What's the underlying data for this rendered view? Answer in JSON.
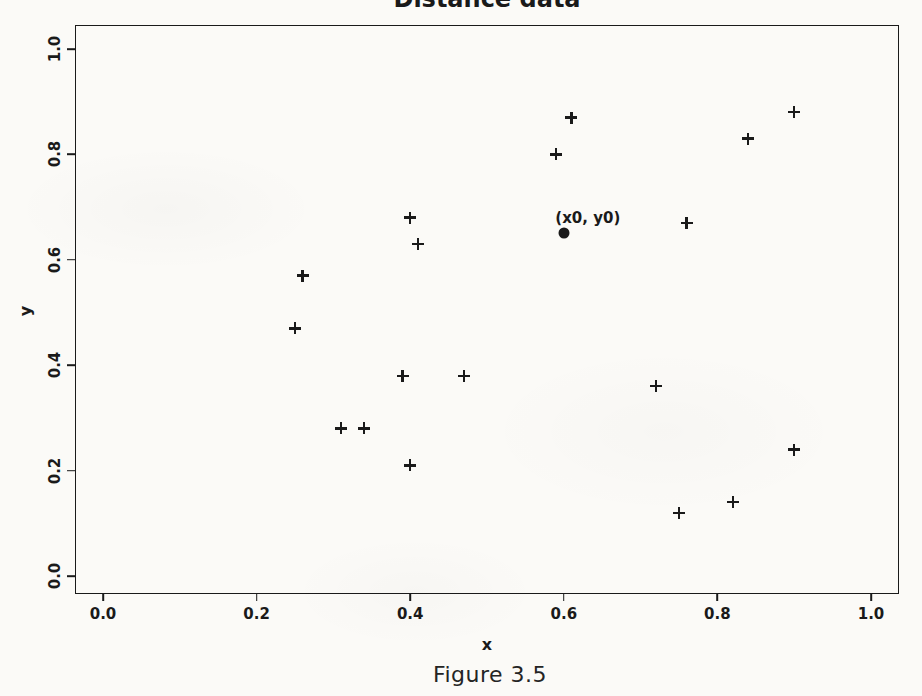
{
  "figure": {
    "caption": "Figure 3.5"
  },
  "colors": {
    "ink": "#1a1a1a",
    "paper": "#fbfaf7"
  },
  "chart_data": {
    "type": "scatter",
    "title": "Distance data",
    "xlabel": "x",
    "ylabel": "y",
    "xlim": [
      0,
      1.05
    ],
    "ylim": [
      0,
      1.02
    ],
    "grid": false,
    "legend": false,
    "marker": "+",
    "xticks": [
      "0.0",
      "0.2",
      "0.4",
      "0.6",
      "0.8",
      "1.0"
    ],
    "yticks": [
      "0.0",
      "0.2",
      "0.4",
      "0.6",
      "0.8",
      "1.0"
    ],
    "points": [
      {
        "x": 0.61,
        "y": 0.87
      },
      {
        "x": 0.59,
        "y": 0.8
      },
      {
        "x": 0.9,
        "y": 0.88
      },
      {
        "x": 0.84,
        "y": 0.83
      },
      {
        "x": 0.76,
        "y": 0.67
      },
      {
        "x": 0.4,
        "y": 0.68
      },
      {
        "x": 0.41,
        "y": 0.63
      },
      {
        "x": 0.26,
        "y": 0.57
      },
      {
        "x": 0.25,
        "y": 0.47
      },
      {
        "x": 0.39,
        "y": 0.38
      },
      {
        "x": 0.47,
        "y": 0.38
      },
      {
        "x": 0.31,
        "y": 0.28
      },
      {
        "x": 0.34,
        "y": 0.28
      },
      {
        "x": 0.4,
        "y": 0.21
      },
      {
        "x": 0.72,
        "y": 0.36
      },
      {
        "x": 0.9,
        "y": 0.24
      },
      {
        "x": 0.82,
        "y": 0.14
      },
      {
        "x": 0.75,
        "y": 0.12
      }
    ],
    "highlight_point": {
      "x": 0.6,
      "y": 0.65,
      "label": "(x0, y0)",
      "marker": "filled-circle"
    }
  }
}
